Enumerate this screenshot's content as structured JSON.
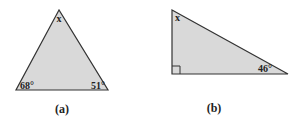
{
  "figures": [
    {
      "id": "a",
      "caption": "(a)",
      "type": "triangle",
      "fill": "#d9d9d9",
      "stroke": "#333333",
      "angles": {
        "top": "x",
        "bottom_left": "68°",
        "bottom_right": "51°"
      }
    },
    {
      "id": "b",
      "caption": "(b)",
      "type": "right-triangle",
      "fill": "#d9d9d9",
      "stroke": "#333333",
      "angles": {
        "top": "x",
        "bottom_left": "right-angle",
        "bottom_right": "46°"
      }
    }
  ]
}
